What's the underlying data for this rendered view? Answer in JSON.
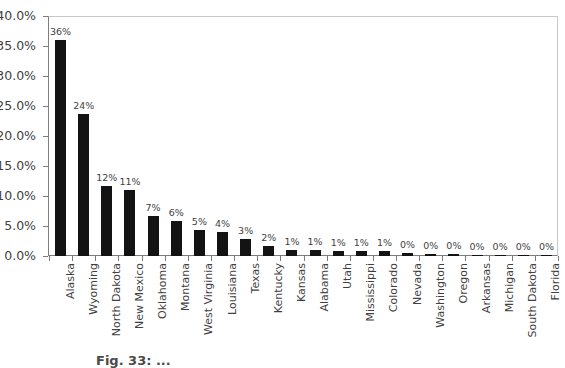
{
  "chart_data": {
    "type": "bar",
    "title": "",
    "subtitle": "",
    "xlabel": "",
    "ylabel": "",
    "ylim": [
      0,
      40
    ],
    "grid": false,
    "legend": null,
    "orientation": "vertical",
    "bar_color": "#131313",
    "axis_color": "#7d7d7d",
    "y_tick_labels": [
      "40.0%",
      "35.0%",
      "30.0%",
      "25.0%",
      "20.0%",
      "15.0%",
      "10.0%",
      "5.0%",
      "0.0%"
    ],
    "y_tick_values": [
      40,
      35,
      30,
      25,
      20,
      15,
      10,
      5,
      0
    ],
    "categories": [
      "Alaska",
      "Wyoming",
      "North Dakota",
      "New Mexico",
      "Oklahoma",
      "Montana",
      "West Virginia",
      "Louisiana",
      "Texas",
      "Kentucky",
      "Kansas",
      "Alabama",
      "Utah",
      "Mississippi",
      "Colorado",
      "Nevada",
      "Washington",
      "Oregon",
      "Arkansas",
      "Michigan",
      "South Dakota",
      "Florida"
    ],
    "values": [
      36.0,
      23.6,
      11.6,
      11.0,
      6.6,
      5.8,
      4.4,
      4.0,
      2.9,
      1.6,
      1.0,
      1.0,
      0.9,
      0.8,
      0.8,
      0.5,
      0.3,
      0.3,
      0.25,
      0.2,
      0.2,
      0.15
    ],
    "data_labels": [
      "36%",
      "24%",
      "12%",
      "11%",
      "7%",
      "6%",
      "5%",
      "4%",
      "3%",
      "2%",
      "1%",
      "1%",
      "1%",
      "1%",
      "1%",
      "0%",
      "0%",
      "0%",
      "0%",
      "0%",
      "0%",
      "0%"
    ]
  },
  "caption": {
    "text": "Fig. 33: ..."
  }
}
